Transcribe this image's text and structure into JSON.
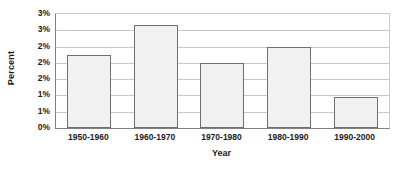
{
  "chart_data": {
    "type": "bar",
    "title": "",
    "subtitle": "",
    "xlabel": "Year",
    "ylabel": "Percent",
    "categories": [
      "1950-1960",
      "1960-1970",
      "1970-1980",
      "1980-1990",
      "1990-2000"
    ],
    "values": [
      2.25,
      3.15,
      2.0,
      2.5,
      0.95
    ],
    "unit": "percent",
    "ylim": [
      0,
      3.5
    ],
    "ytick_values": [
      3.5,
      3.0,
      2.5,
      2.0,
      1.5,
      1.0,
      0.5,
      0
    ],
    "ytick_labels": [
      "3%",
      "3%",
      "2%",
      "2%",
      "2%",
      "1%",
      "1%",
      "0%"
    ],
    "grid": true,
    "grid_axis": "y",
    "legend": false,
    "legend_position": "none",
    "series": [
      {
        "name": "Percent",
        "values": [
          2.25,
          3.15,
          2.0,
          2.5,
          0.95
        ]
      }
    ],
    "colors": {
      "bar_fill": "#f1f1f1",
      "bar_border": "#6e6e6e",
      "gridline": "#c8c8c8",
      "axis": "#808080",
      "text": "#1a1a1a",
      "background": "#ffffff"
    }
  }
}
